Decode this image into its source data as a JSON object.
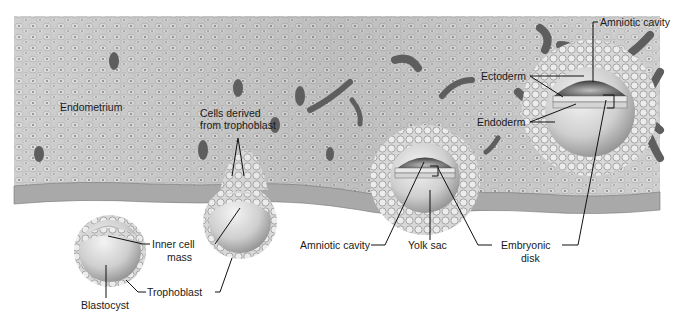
{
  "figure": {
    "colors": {
      "tissue": "#c9c9c9",
      "tissue_light": "#e2e2e2",
      "cell_outline": "#9a9a9a",
      "dark_gland": "#5a5a5a",
      "label_text": "#1a1a1a",
      "background": "#ffffff"
    },
    "labels": {
      "endometrium": "Endometrium",
      "cells_derived_1": "Cells derived",
      "cells_derived_2": "from trophoblast",
      "inner_cell_1": "Inner cell",
      "inner_cell_2": "mass",
      "blastocyst": "Blastocyst",
      "trophoblast": "Trophoblast",
      "amniotic_cavity_bottom": "Amniotic cavity",
      "yolk_sac": "Yolk sac",
      "embryonic_1": "Embryonic",
      "embryonic_2": "disk",
      "amniotic_cavity_top": "Amniotic cavity",
      "ectoderm": "Ectoderm",
      "endoderm": "Endoderm"
    },
    "stages": [
      {
        "name": "free blastocyst",
        "position": "lower left"
      },
      {
        "name": "attaching blastocyst",
        "position": "left-center"
      },
      {
        "name": "implanted embryo (early)",
        "position": "center"
      },
      {
        "name": "implanted embryo (later, bilaminar disk)",
        "position": "upper right"
      }
    ]
  }
}
